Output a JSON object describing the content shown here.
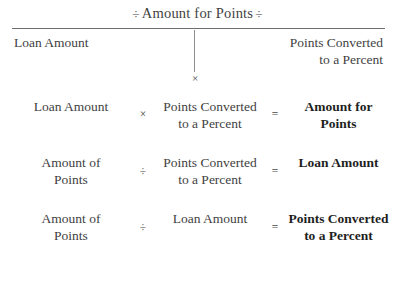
{
  "header": {
    "title_prefix": "÷",
    "title": "Amount for Points",
    "title_suffix": "÷",
    "left_label": "Loan Amount",
    "right_label_line1": "Points Converted",
    "right_label_line2": "to a Percent",
    "operator": "×"
  },
  "equations": [
    {
      "operand_a_line1": "Loan Amount",
      "operand_a_line2": "",
      "operator": "×",
      "operand_b_line1": "Points Converted",
      "operand_b_line2": "to a Percent",
      "equals": "=",
      "result_line1": "Amount for",
      "result_line2": "Points"
    },
    {
      "operand_a_line1": "Amount of",
      "operand_a_line2": "Points",
      "operator": "÷",
      "operand_b_line1": "Points Converted",
      "operand_b_line2": "to a Percent",
      "equals": "=",
      "result_line1": "Loan Amount",
      "result_line2": ""
    },
    {
      "operand_a_line1": "Amount of",
      "operand_a_line2": "Points",
      "operator": "÷",
      "operand_b_line1": "Loan Amount",
      "operand_b_line2": "",
      "equals": "=",
      "result_line1": "Points Converted",
      "result_line2": "to a Percent"
    }
  ],
  "colors": {
    "background": "#ffffff",
    "text": "#3f3f3f",
    "bold_text": "#1f1f1f",
    "rule": "#6d6d6d"
  }
}
